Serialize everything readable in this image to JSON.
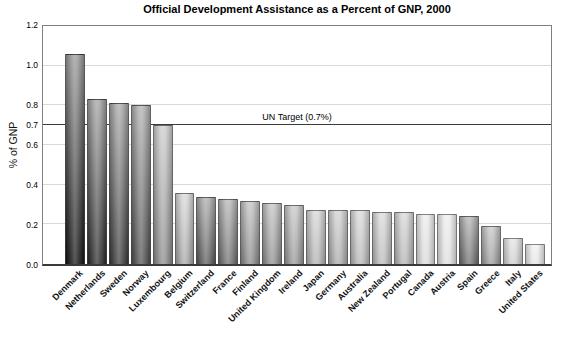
{
  "title": "Official Development Assistance as a Percent of GNP, 2000",
  "y_axis": {
    "label": "% of GNP",
    "tick_labels": [
      "0.0",
      "0.2",
      "0.4",
      "0.6",
      "0.7",
      "0.8",
      "1.0",
      "1.2"
    ],
    "tick_values": [
      0.0,
      0.2,
      0.4,
      0.6,
      0.7,
      0.8,
      1.0,
      1.2
    ]
  },
  "chart_data": {
    "type": "bar",
    "title": "Official Development Assistance as a Percent of GNP, 2000",
    "xlabel": "",
    "ylabel": "% of GNP",
    "ylim": [
      0,
      1.2
    ],
    "grid": "horizontal",
    "gridline_values": [
      0.2,
      0.4,
      0.6,
      0.8,
      1.0
    ],
    "reference_line": {
      "value": 0.7,
      "label": "UN Target (0.7%)"
    },
    "categories": [
      "Denmark",
      "Netherlands",
      "Sweden",
      "Norway",
      "Luxembourg",
      "Belgium",
      "Switzerland",
      "France",
      "Finland",
      "United Kingdom",
      "Ireland",
      "Japan",
      "Germany",
      "Australia",
      "New Zealand",
      "Portugal",
      "Canada",
      "Austria",
      "Spain",
      "Greece",
      "Italy",
      "United States"
    ],
    "values": [
      1.06,
      0.83,
      0.81,
      0.8,
      0.7,
      0.36,
      0.34,
      0.33,
      0.32,
      0.31,
      0.3,
      0.27,
      0.27,
      0.27,
      0.26,
      0.26,
      0.25,
      0.25,
      0.24,
      0.19,
      0.13,
      0.1
    ],
    "bar_gradients": [
      [
        "#969696",
        "#111111"
      ],
      [
        "#a0a0a0",
        "#282828"
      ],
      [
        "#a6a6a6",
        "#383838"
      ],
      [
        "#adadad",
        "#4d4d4d"
      ],
      [
        "#cbcbcb",
        "#878787"
      ],
      [
        "#d7d7d7",
        "#a2a2a2"
      ],
      [
        "#aaaaaa",
        "#575757"
      ],
      [
        "#b3b3b3",
        "#6b6b6b"
      ],
      [
        "#c0c0c0",
        "#858585"
      ],
      [
        "#c2c2c2",
        "#8a8a8a"
      ],
      [
        "#c6c6c6",
        "#929292"
      ],
      [
        "#d5d5d5",
        "#aeaeae"
      ],
      [
        "#d0d0d0",
        "#a6a6a6"
      ],
      [
        "#d8d8d8",
        "#b3b3b3"
      ],
      [
        "#d9d9d9",
        "#b6b6b6"
      ],
      [
        "#d6d6d6",
        "#b0b0b0"
      ],
      [
        "#ebebeb",
        "#d8d8d8"
      ],
      [
        "#ededed",
        "#dcdcdc"
      ],
      [
        "#b0b0b0",
        "#6a6a6a"
      ],
      [
        "#c5c5c5",
        "#979797"
      ],
      [
        "#e3e3e3",
        "#cbcbcb"
      ],
      [
        "#f0f0f0",
        "#e3e3e3"
      ]
    ],
    "colors": {
      "grid": "#d9d9d9",
      "frame": "#7f7f7f",
      "axis": "#3a3a3a",
      "target_line": "#3a3a3a",
      "text": "#000000"
    }
  }
}
